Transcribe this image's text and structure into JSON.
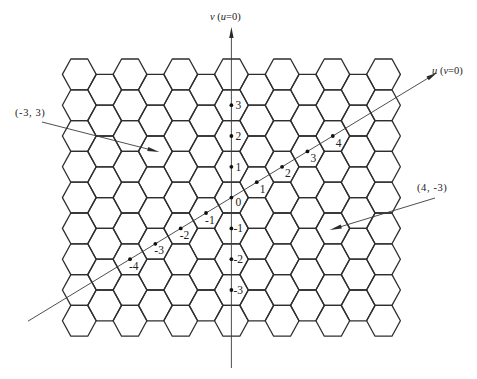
{
  "grid": {
    "columns": 13,
    "hexes_per_long_column": 9,
    "hexes_per_short_column": 8,
    "origin_column_index": 6,
    "origin_row_index": 4
  },
  "axes": {
    "v": {
      "label_parts": [
        {
          "text": "v",
          "italic": true
        },
        {
          "text": " (",
          "italic": false
        },
        {
          "text": "u",
          "italic": true
        },
        {
          "text": "=0)",
          "italic": false
        }
      ]
    },
    "u": {
      "label_parts": [
        {
          "text": "u",
          "italic": true
        },
        {
          "text": " (",
          "italic": false
        },
        {
          "text": "v",
          "italic": true
        },
        {
          "text": "=0)",
          "italic": false
        }
      ]
    }
  },
  "origin": {
    "label": "0"
  },
  "v_axis_points": [
    {
      "v": 3,
      "label": "3"
    },
    {
      "v": 2,
      "label": "2"
    },
    {
      "v": 1,
      "label": "1"
    },
    {
      "v": -1,
      "label": "-1"
    },
    {
      "v": -2,
      "label": "-2"
    },
    {
      "v": -3,
      "label": "-3"
    }
  ],
  "u_axis_points": [
    {
      "u": 4,
      "label": "4"
    },
    {
      "u": 3,
      "label": "3"
    },
    {
      "u": 2,
      "label": "2"
    },
    {
      "u": 1,
      "label": "1"
    },
    {
      "u": -1,
      "label": "-1"
    },
    {
      "u": -2,
      "label": "-2"
    },
    {
      "u": -3,
      "label": "-3"
    },
    {
      "u": -4,
      "label": "-4"
    }
  ],
  "annotations": [
    {
      "text": "(-3, 3)",
      "target": {
        "u": -3,
        "v": 3
      }
    },
    {
      "text": "(4, -3)",
      "target": {
        "u": 4,
        "v": -3
      }
    }
  ]
}
